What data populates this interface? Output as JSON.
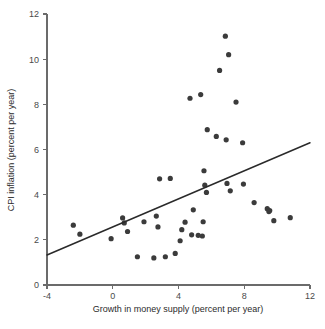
{
  "chart_data": {
    "type": "scatter",
    "title": "",
    "xlabel": "Growth in money supply (percent per year)",
    "ylabel": "CPI inflation (percent per year)",
    "xlim": [
      -4,
      12
    ],
    "ylim": [
      0,
      12
    ],
    "xticks": [
      -4,
      0,
      4,
      8,
      12
    ],
    "xtick_labels": [
      "-4",
      "0",
      "4",
      "8",
      "12"
    ],
    "yticks": [
      0,
      2,
      4,
      6,
      8,
      10,
      12
    ],
    "ytick_labels": [
      "0",
      "2",
      "4",
      "6",
      "8",
      "10",
      "12"
    ],
    "grid": false,
    "legend": null,
    "marker_color": "#3b3b3b",
    "trend_color": "#2a2a2a",
    "axis_color": "#6b6b6b",
    "points": [
      [
        -2.4,
        2.65
      ],
      [
        -2.0,
        2.25
      ],
      [
        -0.1,
        2.05
      ],
      [
        0.6,
        2.97
      ],
      [
        0.7,
        2.75
      ],
      [
        0.9,
        2.37
      ],
      [
        1.5,
        1.25
      ],
      [
        1.9,
        2.8
      ],
      [
        2.5,
        1.2
      ],
      [
        2.65,
        3.05
      ],
      [
        2.75,
        2.57
      ],
      [
        2.85,
        4.7
      ],
      [
        3.2,
        1.25
      ],
      [
        3.5,
        4.72
      ],
      [
        3.8,
        1.4
      ],
      [
        4.1,
        1.96
      ],
      [
        4.2,
        2.45
      ],
      [
        4.4,
        2.78
      ],
      [
        4.7,
        8.27
      ],
      [
        4.8,
        2.22
      ],
      [
        4.9,
        3.33
      ],
      [
        5.2,
        2.2
      ],
      [
        5.35,
        8.43
      ],
      [
        5.45,
        2.17
      ],
      [
        5.5,
        2.8
      ],
      [
        5.55,
        5.06
      ],
      [
        5.6,
        4.42
      ],
      [
        5.7,
        4.1
      ],
      [
        5.75,
        6.88
      ],
      [
        6.3,
        6.58
      ],
      [
        6.5,
        9.5
      ],
      [
        6.85,
        11.02
      ],
      [
        6.9,
        6.43
      ],
      [
        6.95,
        4.5
      ],
      [
        7.05,
        10.2
      ],
      [
        7.15,
        4.17
      ],
      [
        7.5,
        8.1
      ],
      [
        7.9,
        6.3
      ],
      [
        7.95,
        4.47
      ],
      [
        8.6,
        3.65
      ],
      [
        9.4,
        3.38
      ],
      [
        9.5,
        3.25
      ],
      [
        9.55,
        3.3
      ],
      [
        9.8,
        2.85
      ],
      [
        10.8,
        2.98
      ]
    ],
    "trend": {
      "x0": -4,
      "y0": 1.33,
      "x1": 12,
      "y1": 6.3
    }
  }
}
